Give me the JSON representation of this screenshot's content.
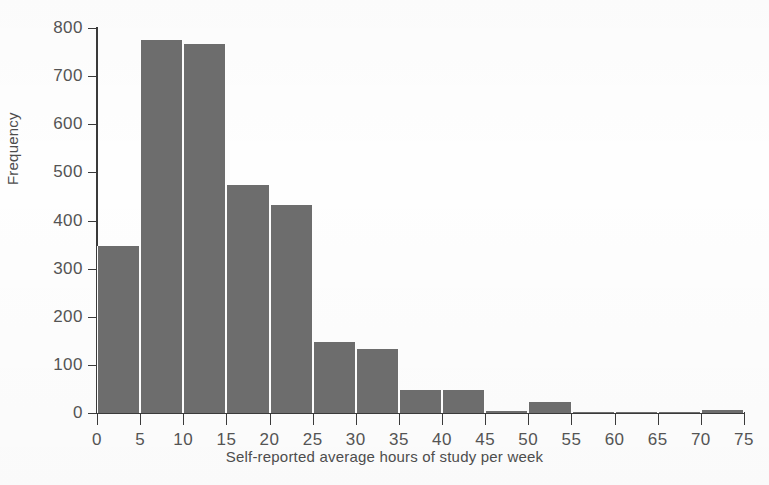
{
  "chart_data": {
    "type": "bar",
    "title": "",
    "xlabel": "Self-reported average hours of study per week",
    "ylabel": "Frequency",
    "xlim": [
      0,
      75
    ],
    "ylim": [
      0,
      800
    ],
    "bin_width": 5,
    "grid": false,
    "legend": null,
    "bar_color": "#6d6d6d",
    "axis_color": "#3a3a3a",
    "background_color": "#ffffff",
    "x_ticks": [
      0,
      5,
      10,
      15,
      20,
      25,
      30,
      35,
      40,
      45,
      50,
      55,
      60,
      65,
      70,
      75
    ],
    "y_ticks": [
      0,
      100,
      200,
      300,
      400,
      500,
      600,
      700,
      800
    ],
    "bins": [
      {
        "range": "0-5",
        "start": 0,
        "end": 5,
        "value": 348
      },
      {
        "range": "5-10",
        "start": 5,
        "end": 10,
        "value": 776
      },
      {
        "range": "10-15",
        "start": 10,
        "end": 15,
        "value": 766
      },
      {
        "range": "15-20",
        "start": 15,
        "end": 20,
        "value": 474
      },
      {
        "range": "20-25",
        "start": 20,
        "end": 25,
        "value": 432
      },
      {
        "range": "25-30",
        "start": 25,
        "end": 30,
        "value": 147
      },
      {
        "range": "30-35",
        "start": 30,
        "end": 35,
        "value": 133
      },
      {
        "range": "35-40",
        "start": 35,
        "end": 40,
        "value": 48
      },
      {
        "range": "40-45",
        "start": 40,
        "end": 45,
        "value": 47
      },
      {
        "range": "45-50",
        "start": 45,
        "end": 50,
        "value": 5
      },
      {
        "range": "50-55",
        "start": 50,
        "end": 55,
        "value": 22
      },
      {
        "range": "55-60",
        "start": 55,
        "end": 60,
        "value": 2
      },
      {
        "range": "60-65",
        "start": 60,
        "end": 65,
        "value": 2
      },
      {
        "range": "65-70",
        "start": 65,
        "end": 70,
        "value": 2
      },
      {
        "range": "70-75",
        "start": 70,
        "end": 75,
        "value": 6
      }
    ],
    "categories": [
      "0-5",
      "5-10",
      "10-15",
      "15-20",
      "20-25",
      "25-30",
      "30-35",
      "35-40",
      "40-45",
      "45-50",
      "50-55",
      "55-60",
      "60-65",
      "65-70",
      "70-75"
    ],
    "values": [
      348,
      776,
      766,
      474,
      432,
      147,
      133,
      48,
      47,
      5,
      22,
      2,
      2,
      2,
      6
    ]
  }
}
